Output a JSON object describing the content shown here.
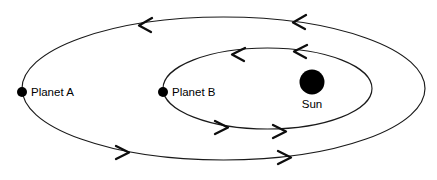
{
  "diagram": {
    "background_color": "#ffffff",
    "stroke_color": "#1a1a1a",
    "body_color": "#000000"
  },
  "bodies": {
    "sun": {
      "label": "Sun",
      "cx": 312,
      "cy": 82,
      "r": 12.5,
      "label_x": 312,
      "label_y": 105
    },
    "planet_a": {
      "label": "Planet A",
      "cx": 22,
      "cy": 92,
      "r": 5,
      "label_x": 31,
      "label_y": 93
    },
    "planet_b": {
      "label": "Planet B",
      "cx": 163,
      "cy": 92,
      "r": 5,
      "label_x": 172,
      "label_y": 93
    }
  },
  "orbits": {
    "outer": {
      "name": "Planet A orbit",
      "cx": 223.5,
      "cy": 88.5,
      "rx": 201.5,
      "ry": 71.5,
      "direction": "counterclockwise"
    },
    "inner": {
      "name": "Planet B orbit",
      "cx": 267.5,
      "cy": 88.5,
      "rx": 104.5,
      "ry": 40.5,
      "direction": "counterclockwise"
    }
  },
  "arrows": {
    "outer_top_left": {
      "x": 142,
      "y": 25,
      "dir": "left"
    },
    "outer_top_right": {
      "x": 296,
      "y": 22,
      "dir": "left"
    },
    "outer_bottom_left": {
      "x": 126,
      "y": 152,
      "dir": "right"
    },
    "outer_bottom_right": {
      "x": 288,
      "y": 157,
      "dir": "right"
    },
    "inner_top_left": {
      "x": 235,
      "y": 54,
      "dir": "left"
    },
    "inner_top_right": {
      "x": 297,
      "y": 51,
      "dir": "left"
    },
    "inner_bottom_left": {
      "x": 225,
      "y": 127,
      "dir": "right"
    },
    "inner_bottom_right": {
      "x": 283,
      "y": 131,
      "dir": "right"
    }
  }
}
